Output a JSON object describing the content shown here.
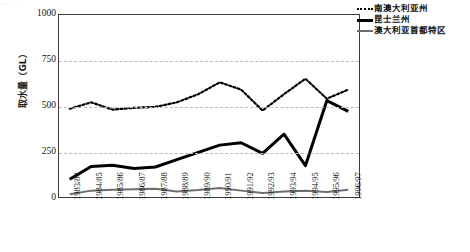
{
  "artifact_text": "·· · ·",
  "chart_data": {
    "type": "line",
    "title": "",
    "xlabel": "",
    "ylabel": "取水量（GL）",
    "ylim": [
      0,
      1000
    ],
    "yticks": [
      0,
      250,
      500,
      750,
      1000
    ],
    "grid": true,
    "legend_position": "top-right",
    "categories": [
      "1983/84",
      "1984/85",
      "1985/86",
      "1986/87",
      "1987/88",
      "1988/89",
      "1989/90",
      "1990/91",
      "1991/92",
      "1992/93",
      "1993/94",
      "1994/95",
      "1995/96",
      "1996/97"
    ],
    "series": [
      {
        "name": "南澳大利亚州",
        "style": "dotted",
        "color": "#000000",
        "values": [
          485,
          520,
          480,
          490,
          495,
          520,
          565,
          630,
          590,
          475,
          565,
          650,
          540,
          590
        ]
      },
      {
        "name": "昆士兰州",
        "style": "solid-bold",
        "color": "#000000",
        "values": [
          98,
          168,
          175,
          157,
          165,
          205,
          245,
          285,
          298,
          240,
          345,
          172,
          530,
          470
        ]
      },
      {
        "name": "澳大利亚首都特区",
        "style": "solid-gray",
        "color": "#6e6e6e",
        "values": [
          15,
          35,
          40,
          43,
          45,
          30,
          38,
          50,
          35,
          22,
          30,
          35,
          28,
          40
        ]
      }
    ]
  }
}
